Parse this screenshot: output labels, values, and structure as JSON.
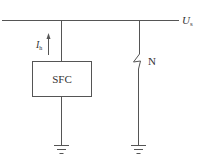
{
  "diagram": {
    "bus": {
      "label_main": "U",
      "label_sub": "s"
    },
    "sfc_branch": {
      "box_label": "SFC",
      "current_label_main": "I",
      "current_label_sub": "h",
      "current_direction": "up"
    },
    "neutral_branch": {
      "label": "N",
      "symbol": "zigzag-break"
    },
    "grounds": [
      "ground-sfc",
      "ground-neutral"
    ],
    "colors": {
      "line": "#555555",
      "text": "#333333",
      "background": "#ffffff"
    }
  }
}
